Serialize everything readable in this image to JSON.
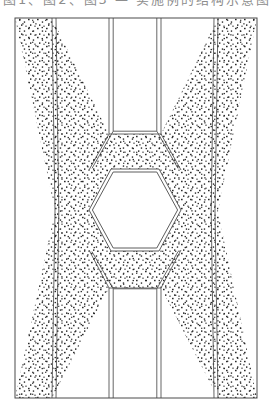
{
  "figure": {
    "type": "technical-line-drawing",
    "style": "patent-style cross-sectional diagram",
    "caption_fragment": "图1、图2、图3 — 实施例的结构示意图",
    "background_color": "#ffffff",
    "line_color": "#3f3f3f",
    "hatch_color": "#1a1a1a",
    "frame": {
      "label": "outer-rectangular-frame",
      "x": 15,
      "y": 18,
      "width": 242,
      "height": 380,
      "stroke_width": 1.0
    },
    "regions": [
      {
        "name": "stippled-hourglass-band",
        "fill": "stipple",
        "description": "X / hourglass shaped dotted region spanning the full frame"
      },
      {
        "name": "central-hexagon-void",
        "fill": "white",
        "description": "clear hexagonal opening at the center"
      },
      {
        "name": "upper-trapezoid-void",
        "fill": "white",
        "description": "clear trapezoid notch descending from the top edge"
      },
      {
        "name": "lower-trapezoid-void",
        "fill": "white",
        "description": "clear trapezoid notch rising from the bottom edge"
      },
      {
        "name": "left-triangle-void",
        "fill": "white",
        "description": "clear triangular notch at the left edge"
      },
      {
        "name": "right-triangle-void",
        "fill": "white",
        "description": "clear triangular notch at the right edge"
      }
    ],
    "hexagon": {
      "label": "central-hexagon",
      "center_x": 135,
      "center_y": 210,
      "half_width": 46,
      "half_height": 41,
      "flat_top_half_width": 24,
      "double_line": true
    },
    "band": {
      "label": "stipple-band",
      "double_line_edges": true,
      "inner_offset": 2.6,
      "dot_size": 1.4,
      "dot_spacing": 9.0
    },
    "notches": {
      "left_vertex_x": 55,
      "right_vertex_x": 218,
      "vertex_y": 211,
      "top_opening_half_width": 26,
      "bottom_opening_half_width": 26,
      "top_inner_y": 134,
      "bottom_inner_y": 288
    }
  }
}
